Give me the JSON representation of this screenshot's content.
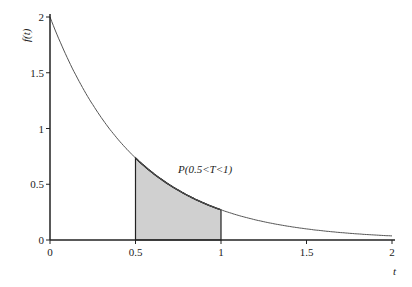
{
  "chart_data": {
    "type": "line",
    "title": "",
    "xlabel": "t",
    "ylabel": "f(t)",
    "function": "f(t) = 2e^(-2t)",
    "xlim": [
      0,
      2
    ],
    "ylim": [
      0,
      2
    ],
    "x_ticks": [
      "0",
      "0.5",
      "1",
      "1.5",
      "2"
    ],
    "y_ticks": [
      "0",
      "0.5",
      "1",
      "1.5",
      "2"
    ],
    "grid": false,
    "series": [
      {
        "name": "f(t)",
        "x": [
          0,
          0.25,
          0.5,
          0.75,
          1,
          1.25,
          1.5,
          1.75,
          2
        ],
        "values": [
          2,
          1.213,
          0.736,
          0.446,
          0.271,
          0.164,
          0.1,
          0.06,
          0.037
        ]
      }
    ],
    "shaded_region": {
      "from": 0.5,
      "to": 1,
      "label": "P(0.5<T<1)",
      "color": "#d0d0d0"
    },
    "annotations": [
      "P(0.5<T<1)"
    ]
  },
  "labels": {
    "x": "t",
    "y": "f(t)",
    "region": "P(0.5<T<1)"
  },
  "ticks": {
    "x": [
      "0",
      "0.5",
      "1",
      "1.5",
      "2"
    ],
    "y": [
      "0",
      "0.5",
      "1",
      "1.5",
      "2"
    ]
  }
}
